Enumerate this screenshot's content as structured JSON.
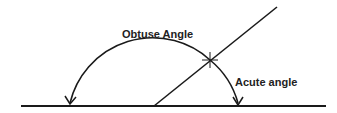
{
  "diagram": {
    "labels": {
      "obtuse": "Obtuse Angle",
      "acute": "Acute angle"
    },
    "colors": {
      "stroke": "#1a1a1a",
      "background": "#ffffff"
    }
  }
}
